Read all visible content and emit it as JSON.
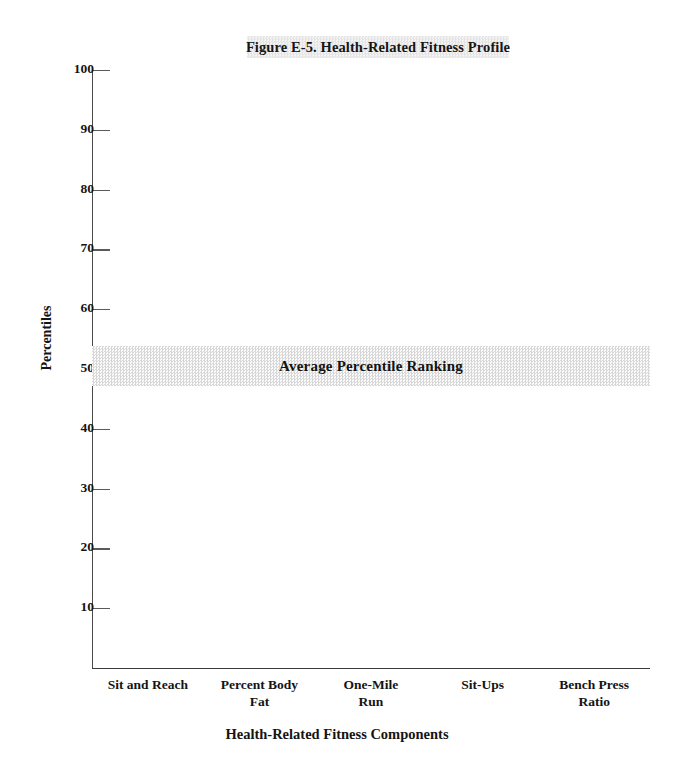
{
  "chart_data": {
    "type": "bar",
    "title": "Figure E-5. Health-Related Fitness Profile",
    "xlabel": "Health-Related Fitness Components",
    "ylabel": "Percentiles",
    "categories": [
      "Sit and Reach",
      "Percent Body Fat",
      "One-Mile Run",
      "Sit-Ups",
      "Bench Press Ratio"
    ],
    "values": [
      null,
      null,
      null,
      null,
      null
    ],
    "ylim": [
      0,
      100
    ],
    "yticks": [
      10,
      20,
      30,
      40,
      50,
      60,
      70,
      80,
      90,
      100
    ],
    "grid": false,
    "legend": "none",
    "annotations": [
      {
        "label": "Average Percentile Ranking",
        "type": "horizontal-band",
        "y_center": 50,
        "y_start": 47,
        "y_end": 54
      }
    ]
  },
  "title": {
    "text": "Figure E-5. Health-Related Fitness Profile"
  },
  "axes": {
    "y_title": "Percentiles",
    "x_title": "Health-Related Fitness Components",
    "y_ticks": [
      {
        "value": 100,
        "label": "100"
      },
      {
        "value": 90,
        "label": "90"
      },
      {
        "value": 80,
        "label": "80"
      },
      {
        "value": 70,
        "label": "70"
      },
      {
        "value": 60,
        "label": "60"
      },
      {
        "value": 50,
        "label": "50"
      },
      {
        "value": 40,
        "label": "40"
      },
      {
        "value": 30,
        "label": "30"
      },
      {
        "value": 20,
        "label": "20"
      },
      {
        "value": 10,
        "label": "10"
      }
    ],
    "x_categories": [
      {
        "line1": "Sit and Reach",
        "line2": ""
      },
      {
        "line1": "Percent Body",
        "line2": "Fat"
      },
      {
        "line1": "One-Mile",
        "line2": "Run"
      },
      {
        "line1": "Sit-Ups",
        "line2": ""
      },
      {
        "line1": "Bench Press",
        "line2": "Ratio"
      }
    ]
  },
  "band": {
    "label": "Average Percentile Ranking"
  },
  "colors": {
    "axis": "#3c3c3c",
    "text": "#141414",
    "band_fill": "#d8d8d8",
    "title_fill": "#e4e4e4",
    "background": "#ffffff"
  }
}
